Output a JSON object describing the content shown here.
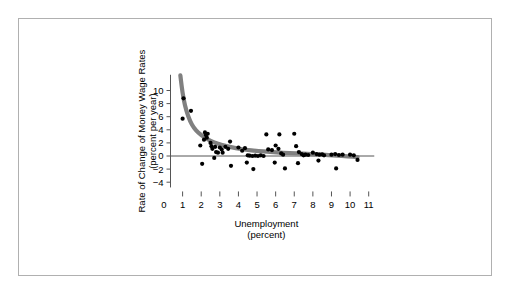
{
  "figure": {
    "border_color": "#b0b0b0",
    "background": "#ffffff"
  },
  "chart_data": {
    "type": "scatter",
    "title": "",
    "xlabel": "Unemployment",
    "xlabel_sub": "(percent)",
    "ylabel": "Rate of Change of Money Wage Rates",
    "ylabel_sub": "(percent per year)",
    "xlim": [
      0,
      11.5
    ],
    "ylim": [
      -4.8,
      12.4
    ],
    "xticks": [
      0,
      1,
      2,
      3,
      4,
      5,
      6,
      7,
      8,
      9,
      10,
      11
    ],
    "xtick_labels": [
      "0",
      "1",
      "2",
      "3",
      "4",
      "5",
      "6",
      "7",
      "8",
      "9",
      "10",
      "11"
    ],
    "yticks": [
      -4,
      -2,
      0,
      2,
      4,
      6,
      8,
      10
    ],
    "ytick_labels": [
      "−4",
      "−2",
      "0",
      "2",
      "4",
      "6",
      "8",
      "10"
    ],
    "grid": false,
    "legend": "none",
    "zero_line": true,
    "point_color": "#000000",
    "curve_color": "#808080",
    "series": [
      {
        "name": "Observations",
        "marker": "filled-circle",
        "points": [
          [
            1.05,
            8.8
          ],
          [
            1.45,
            6.9
          ],
          [
            1.0,
            5.7
          ],
          [
            2.2,
            3.6
          ],
          [
            2.25,
            3.2
          ],
          [
            2.3,
            2.8
          ],
          [
            2.35,
            3.4
          ],
          [
            2.15,
            2.5
          ],
          [
            1.95,
            1.6
          ],
          [
            2.5,
            2.0
          ],
          [
            2.55,
            1.5
          ],
          [
            2.6,
            1.1
          ],
          [
            2.75,
            1.4
          ],
          [
            2.8,
            0.6
          ],
          [
            2.9,
            0.5
          ],
          [
            3.0,
            1.3
          ],
          [
            3.1,
            1.0
          ],
          [
            3.15,
            0.5
          ],
          [
            3.3,
            1.4
          ],
          [
            3.45,
            1.1
          ],
          [
            3.55,
            2.2
          ],
          [
            2.05,
            -1.2
          ],
          [
            2.7,
            -0.3
          ],
          [
            3.6,
            -1.5
          ],
          [
            4.0,
            1.3
          ],
          [
            4.2,
            0.8
          ],
          [
            4.35,
            1.2
          ],
          [
            4.5,
            0.1
          ],
          [
            4.6,
            0.05
          ],
          [
            4.75,
            0.0
          ],
          [
            4.9,
            0.05
          ],
          [
            5.05,
            0.0
          ],
          [
            5.2,
            0.1
          ],
          [
            5.35,
            0.0
          ],
          [
            4.45,
            -1.0
          ],
          [
            4.8,
            -2.0
          ],
          [
            5.5,
            3.3
          ],
          [
            6.2,
            3.3
          ],
          [
            5.6,
            1.0
          ],
          [
            5.8,
            0.9
          ],
          [
            6.0,
            1.6
          ],
          [
            6.15,
            1.1
          ],
          [
            6.3,
            0.4
          ],
          [
            6.4,
            0.2
          ],
          [
            5.95,
            -1.0
          ],
          [
            6.5,
            -1.9
          ],
          [
            7.0,
            3.4
          ],
          [
            7.1,
            1.5
          ],
          [
            7.25,
            0.6
          ],
          [
            7.4,
            0.3
          ],
          [
            7.5,
            0.1
          ],
          [
            7.6,
            0.2
          ],
          [
            7.75,
            0.15
          ],
          [
            7.2,
            -1.1
          ],
          [
            8.0,
            0.5
          ],
          [
            8.2,
            0.3
          ],
          [
            8.35,
            0.2
          ],
          [
            8.5,
            0.25
          ],
          [
            8.6,
            0.1
          ],
          [
            8.3,
            -0.7
          ],
          [
            9.0,
            0.2
          ],
          [
            9.2,
            0.3
          ],
          [
            9.4,
            0.15
          ],
          [
            9.6,
            0.2
          ],
          [
            9.25,
            -1.9
          ],
          [
            10.0,
            0.2
          ],
          [
            10.2,
            0.1
          ],
          [
            10.4,
            -0.6
          ]
        ]
      }
    ],
    "fit_curve": {
      "name": "Phillips curve fit",
      "points": [
        [
          0.88,
          12.3
        ],
        [
          0.95,
          10.6
        ],
        [
          1.05,
          8.7
        ],
        [
          1.2,
          6.9
        ],
        [
          1.4,
          5.3
        ],
        [
          1.6,
          4.3
        ],
        [
          1.85,
          3.5
        ],
        [
          2.15,
          2.9
        ],
        [
          2.5,
          2.3
        ],
        [
          2.9,
          1.85
        ],
        [
          3.35,
          1.5
        ],
        [
          3.85,
          1.2
        ],
        [
          4.4,
          0.95
        ],
        [
          5.0,
          0.78
        ],
        [
          5.7,
          0.62
        ],
        [
          6.4,
          0.5
        ],
        [
          7.1,
          0.4
        ],
        [
          7.8,
          0.3
        ],
        [
          8.5,
          0.2
        ],
        [
          9.2,
          0.08
        ],
        [
          9.9,
          -0.05
        ],
        [
          10.4,
          -0.18
        ]
      ]
    }
  }
}
